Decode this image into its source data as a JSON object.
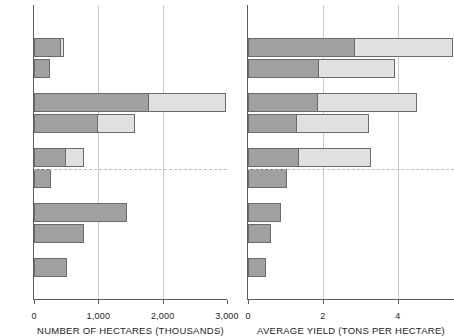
{
  "figure": {
    "background": "#ffffff",
    "colors": {
      "series_1_fill": "#a0a0a0",
      "series_2_fill": "#e0e0e0",
      "bar_outline": "#6b6b6b",
      "axis": "#5d5d5d",
      "gridline": "#c9c9c9",
      "reference_line": "#bdbdbd",
      "text": "#1d1d1d"
    }
  },
  "chart_data": [
    {
      "id": "hectares",
      "type": "bar",
      "orientation": "horizontal",
      "stacked": true,
      "title": "",
      "xlabel": "NUMBER OF HECTARES (THOUSANDS)",
      "ylabel": "",
      "xlim": [
        0,
        3000
      ],
      "ylim": [
        0,
        10
      ],
      "grid": "vertical",
      "legend": "none",
      "xticks": [
        0,
        1000,
        2000,
        3000
      ],
      "xticklabels": [
        "0",
        "1,000",
        "2,000",
        "3,000"
      ],
      "groups": [
        {
          "index": 1,
          "bars": [
            {
              "row": "a",
              "segments": [
                {
                  "series": "first",
                  "value": 420
                },
                {
                  "series": "second",
                  "value": 60
                }
              ],
              "total": 480
            },
            {
              "row": "b",
              "segments": [
                {
                  "series": "first",
                  "value": 250
                }
              ],
              "total": 250
            }
          ]
        },
        {
          "index": 2,
          "bars": [
            {
              "row": "a",
              "segments": [
                {
                  "series": "first",
                  "value": 1780
                },
                {
                  "series": "second",
                  "value": 1220
                }
              ],
              "total": 3000
            },
            {
              "row": "b",
              "segments": [
                {
                  "series": "first",
                  "value": 1000
                },
                {
                  "series": "second",
                  "value": 580
                }
              ],
              "total": 1580
            }
          ]
        },
        {
          "index": 3,
          "bars": [
            {
              "row": "a",
              "segments": [
                {
                  "series": "first",
                  "value": 500
                },
                {
                  "series": "second",
                  "value": 300
                }
              ],
              "total": 800
            },
            {
              "row": "b",
              "segments": [
                {
                  "series": "first",
                  "value": 260
                }
              ],
              "total": 260
            }
          ]
        },
        {
          "index": 4,
          "bars": [
            {
              "row": "a",
              "segments": [
                {
                  "series": "first",
                  "value": 1450
                }
              ],
              "total": 1450
            },
            {
              "row": "b",
              "segments": [
                {
                  "series": "first",
                  "value": 780
                }
              ],
              "total": 780
            }
          ]
        },
        {
          "index": 5,
          "bars": [
            {
              "row": "a",
              "segments": [
                {
                  "series": "first",
                  "value": 520
                }
              ],
              "total": 520
            }
          ]
        }
      ],
      "reference_line": {
        "orientation": "horizontal",
        "style": "dashed"
      }
    },
    {
      "id": "yield",
      "type": "bar",
      "orientation": "horizontal",
      "stacked": true,
      "title": "",
      "xlabel": "AVERAGE YIELD (TONS PER HECTARE)",
      "ylabel": "",
      "xlim": [
        0,
        5.5
      ],
      "ylim": [
        0,
        10
      ],
      "grid": "vertical",
      "legend": "none",
      "xticks": [
        0,
        2,
        4
      ],
      "xticklabels": [
        "0",
        "2",
        "4"
      ],
      "groups": [
        {
          "index": 1,
          "bars": [
            {
              "row": "a",
              "segments": [
                {
                  "series": "first",
                  "value": 2.85
                },
                {
                  "series": "second",
                  "value": 2.65
                }
              ],
              "total": 5.5,
              "clipped": true
            },
            {
              "row": "b",
              "segments": [
                {
                  "series": "first",
                  "value": 1.9
                },
                {
                  "series": "second",
                  "value": 2.05
                }
              ],
              "total": 3.95
            }
          ]
        },
        {
          "index": 2,
          "bars": [
            {
              "row": "a",
              "segments": [
                {
                  "series": "first",
                  "value": 1.87
                },
                {
                  "series": "second",
                  "value": 2.68
                }
              ],
              "total": 4.55
            },
            {
              "row": "b",
              "segments": [
                {
                  "series": "first",
                  "value": 1.3
                },
                {
                  "series": "second",
                  "value": 1.95
                }
              ],
              "total": 3.25
            }
          ]
        },
        {
          "index": 3,
          "bars": [
            {
              "row": "a",
              "segments": [
                {
                  "series": "first",
                  "value": 1.35
                },
                {
                  "series": "second",
                  "value": 1.95
                }
              ],
              "total": 3.3
            },
            {
              "row": "b",
              "segments": [
                {
                  "series": "first",
                  "value": 1.05
                }
              ],
              "total": 1.05
            }
          ]
        },
        {
          "index": 4,
          "bars": [
            {
              "row": "a",
              "segments": [
                {
                  "series": "first",
                  "value": 0.87
                }
              ],
              "total": 0.87
            },
            {
              "row": "b",
              "segments": [
                {
                  "series": "first",
                  "value": 0.62
                }
              ],
              "total": 0.62
            }
          ]
        },
        {
          "index": 5,
          "bars": [
            {
              "row": "a",
              "segments": [
                {
                  "series": "first",
                  "value": 0.47
                }
              ],
              "total": 0.47
            }
          ]
        }
      ],
      "reference_line": {
        "orientation": "horizontal",
        "style": "dashed"
      }
    }
  ]
}
